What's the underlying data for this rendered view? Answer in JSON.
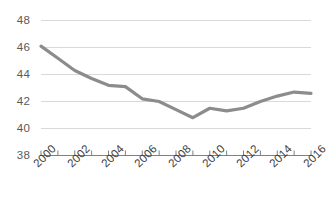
{
  "chart_data": {
    "type": "line",
    "title": "",
    "subtitle": "",
    "xlabel": "",
    "ylabel": "",
    "x": [
      2000,
      2001,
      2002,
      2003,
      2004,
      2005,
      2006,
      2007,
      2008,
      2009,
      2010,
      2011,
      2012,
      2013,
      2014,
      2015,
      2016
    ],
    "values": [
      46.1,
      45.2,
      44.3,
      43.7,
      43.2,
      43.1,
      42.2,
      42.0,
      41.4,
      40.8,
      41.5,
      41.3,
      41.5,
      42.0,
      42.4,
      42.7,
      42.6
    ],
    "series": [
      {
        "name": "",
        "values": [
          46.1,
          45.2,
          44.3,
          43.7,
          43.2,
          43.1,
          42.2,
          42.0,
          41.4,
          40.8,
          41.5,
          41.3,
          41.5,
          42.0,
          42.4,
          42.7,
          42.6
        ]
      }
    ],
    "xlim": [
      2000,
      2016
    ],
    "ylim": [
      38,
      48
    ],
    "ytick_labels": [
      "48",
      "46",
      "44",
      "42",
      "40",
      "38"
    ],
    "ytick_values": [
      48,
      46,
      44,
      42,
      40,
      38
    ],
    "xtick_values": [
      2000,
      2001,
      2002,
      2003,
      2004,
      2005,
      2006,
      2007,
      2008,
      2009,
      2010,
      2011,
      2012,
      2013,
      2014,
      2015,
      2016
    ],
    "xtick_labels_shown": [
      "2000",
      "2002",
      "2004",
      "2006",
      "2008",
      "2010",
      "2012",
      "2014",
      "2016"
    ],
    "xtick_label_values": [
      2000,
      2002,
      2004,
      2006,
      2008,
      2010,
      2012,
      2014,
      2016
    ],
    "grid": "horizontal",
    "legend": "none",
    "annotations": [],
    "colors": {
      "line": "#8c8c8c",
      "grid": "#d9d9d9",
      "axis": "#808080",
      "ytick_text": "#595959",
      "xtick_text": "#404040",
      "background": "#ffffff"
    },
    "line_width_px": 3.2
  }
}
